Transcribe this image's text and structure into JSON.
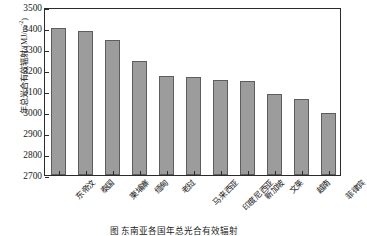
{
  "chart_data": {
    "type": "bar",
    "title": "",
    "xlabel": "",
    "ylabel": "年总光合有效辐射/(MJ/m⁻²)",
    "ylabel_text": "年总光合有效辐射/(MJ/m",
    "ylabel_sup": "-2",
    "ylabel_tail": ")",
    "ylim": [
      2700,
      3500
    ],
    "ytick_step": 100,
    "grid": false,
    "legend": null,
    "categories": [
      "东帝汶",
      "泰国",
      "柬埔寨",
      "缅甸",
      "老挝",
      "马来西亚",
      "印度尼西亚",
      "新加坡",
      "文莱",
      "越南",
      "菲律宾"
    ],
    "values": [
      3400,
      3385,
      3345,
      3245,
      3173,
      3165,
      3152,
      3148,
      3085,
      3062,
      2995
    ],
    "ytick_labels": [
      "3500",
      "3400",
      "3300",
      "3200",
      "3100",
      "3000",
      "2900",
      "2800",
      "2700"
    ],
    "ytick_values": [
      3500,
      3400,
      3300,
      3200,
      3100,
      3000,
      2900,
      2800,
      2700
    ],
    "bar_color": "#9c9c9c",
    "bar_edge_color": "#5d5d5d",
    "axis_color": "#2b2b2b"
  },
  "caption": {
    "text": "图    东南亚各国年总光合有效辐射"
  }
}
